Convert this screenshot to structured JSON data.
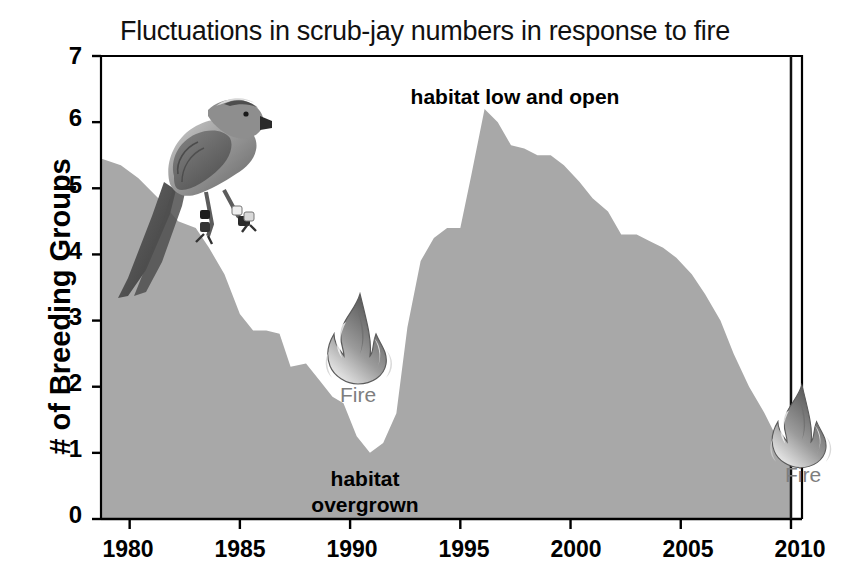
{
  "chart_data": {
    "type": "area",
    "title": "Fluctuations in scrub-jay numbers in response to fire",
    "xlabel": "",
    "ylabel": "# of Breeding Groups",
    "xlim": [
      1978.7,
      2010.5
    ],
    "ylim": [
      0,
      7
    ],
    "grid": false,
    "legend": "none",
    "xticks": [
      1980,
      1985,
      1990,
      1995,
      2000,
      2005,
      2010
    ],
    "yticks": [
      0,
      1,
      2,
      3,
      4,
      5,
      6,
      7
    ],
    "series": [
      {
        "name": "Breeding groups",
        "x": [
          1978.7,
          1979.6,
          1980.4,
          1981.3,
          1982.2,
          1983.0,
          1983.6,
          1984.3,
          1985.0,
          1985.6,
          1986.2,
          1986.8,
          1987.3,
          1988.0,
          1988.6,
          1989.2,
          1989.7,
          1990.3,
          1990.9,
          1991.5,
          1992.1,
          1992.6,
          1993.2,
          1993.8,
          1994.4,
          1995.0,
          1995.5,
          1996.1,
          1996.7,
          1997.3,
          1997.9,
          1998.5,
          1999.1,
          1999.7,
          2000.4,
          2001.0,
          2001.7,
          2002.3,
          2003.0,
          2003.6,
          2004.2,
          2004.8,
          2005.5,
          2006.1,
          2006.8,
          2007.4,
          2008.1,
          2008.8,
          2009.4,
          2010.0
        ],
        "y": [
          5.45,
          5.35,
          5.15,
          4.85,
          4.5,
          4.4,
          4.1,
          3.7,
          3.1,
          2.85,
          2.85,
          2.8,
          2.3,
          2.35,
          2.1,
          1.85,
          1.75,
          1.25,
          1.0,
          1.15,
          1.6,
          2.9,
          3.9,
          4.25,
          4.4,
          4.4,
          5.2,
          6.2,
          6.0,
          5.65,
          5.6,
          5.5,
          5.5,
          5.35,
          5.1,
          4.85,
          4.65,
          4.3,
          4.3,
          4.2,
          4.1,
          3.95,
          3.7,
          3.4,
          3.0,
          2.5,
          2.0,
          1.6,
          1.2,
          0.85
        ]
      }
    ],
    "annotations": [
      {
        "id": "habitat-low-open",
        "text": "habitat low and open",
        "x": 1996.0,
        "y": 6.6
      },
      {
        "id": "habitat-overgrown",
        "text": "habitat\novergrown",
        "x": 1990.2,
        "y": 1.1
      },
      {
        "id": "fire-1",
        "text": "Fire",
        "x": 1990.0,
        "y": 2.0
      },
      {
        "id": "fire-2",
        "text": "Fire",
        "x": 2010.0,
        "y": 1.6
      }
    ],
    "series_color": "#a8a8a8",
    "axis_color": "#000000",
    "marker_line_color": "#111111"
  },
  "figure": {
    "title": "Fluctuations in scrub-jay numbers in response to fire",
    "y_axis_title": "# of Breeding Groups",
    "y_ticks": [
      "7",
      "6",
      "5",
      "4",
      "3",
      "2",
      "1",
      "0"
    ],
    "x_ticks": [
      "1980",
      "1985",
      "1990",
      "1995",
      "2000",
      "2005",
      "2010"
    ],
    "annotation_low_open": "habitat low and open",
    "annotation_overgrown": "habitat\novergrown",
    "fire_label_1": "Fire",
    "fire_label_2": "Fire",
    "icons": {
      "scrub_jay": "bird-photo",
      "fire_left": "fire-flame-icon",
      "fire_right": "fire-flame-icon"
    },
    "colors": {
      "area_fill": "#a8a8a8",
      "axis": "#000000",
      "text": "#000000",
      "fire_label": "#7e7e7e"
    }
  }
}
